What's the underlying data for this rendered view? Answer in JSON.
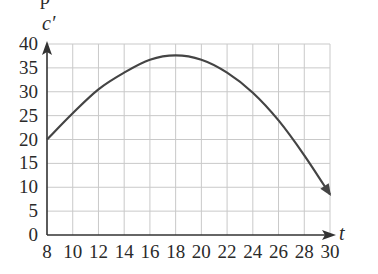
{
  "chart_data": {
    "type": "line",
    "title": "",
    "xlabel": "t",
    "ylabel": "c′",
    "xlim": [
      8,
      30
    ],
    "ylim": [
      0,
      40
    ],
    "grid": true,
    "legend": null,
    "x_ticks": [
      8,
      10,
      12,
      14,
      16,
      18,
      20,
      22,
      24,
      26,
      28,
      30
    ],
    "y_ticks": [
      0,
      5,
      10,
      15,
      20,
      25,
      30,
      35,
      40
    ],
    "x_tick_labels": [
      "8",
      "10",
      "12",
      "14",
      "16",
      "18",
      "20",
      "22",
      "24",
      "26",
      "28",
      "30"
    ],
    "y_tick_labels": [
      "0",
      "5",
      "10",
      "15",
      "20",
      "25",
      "30",
      "35",
      "40"
    ],
    "series": [
      {
        "name": "c′(t)",
        "x": [
          8,
          10,
          12,
          14,
          16,
          18,
          20,
          22,
          24,
          26,
          28,
          30
        ],
        "values": [
          20,
          25.5,
          30.5,
          34,
          36.7,
          37.6,
          36.7,
          34,
          29.8,
          24,
          16.7,
          8.5
        ],
        "end_marker": "arrow"
      }
    ],
    "annotations": [
      "y-axis arrow",
      "x-axis arrow"
    ]
  },
  "header_fragment": "p"
}
